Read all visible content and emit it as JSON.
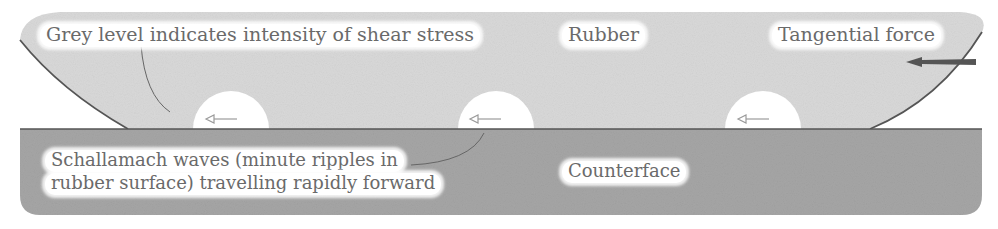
{
  "diagram": {
    "labels": {
      "shear_stress": "Grey level indicates intensity of shear stress",
      "rubber": "Rubber",
      "tangential_force": "Tangential force",
      "waves_line1": "Schallamach waves (minute ripples in",
      "waves_line2": "rubber surface) travelling rapidly forward",
      "counterface": "Counterface"
    },
    "regions": [
      {
        "name": "rubber",
        "color": "#d9d9d9"
      },
      {
        "name": "counterface",
        "color": "#a6a6a6"
      }
    ],
    "waves": [
      {
        "id": 1,
        "center_x": 231,
        "direction": "left"
      },
      {
        "id": 2,
        "center_x": 496,
        "direction": "left"
      },
      {
        "id": 3,
        "center_x": 763,
        "direction": "left"
      }
    ],
    "force_arrow": {
      "direction": "left",
      "color": "#555555"
    },
    "colors": {
      "rubber": "#d9d9d9",
      "counterface": "#a6a6a6",
      "outline": "#555555",
      "stress_shadow": "#5a5a5a",
      "label_text": "#6a6a6a",
      "label_bg": "#ffffff"
    }
  }
}
